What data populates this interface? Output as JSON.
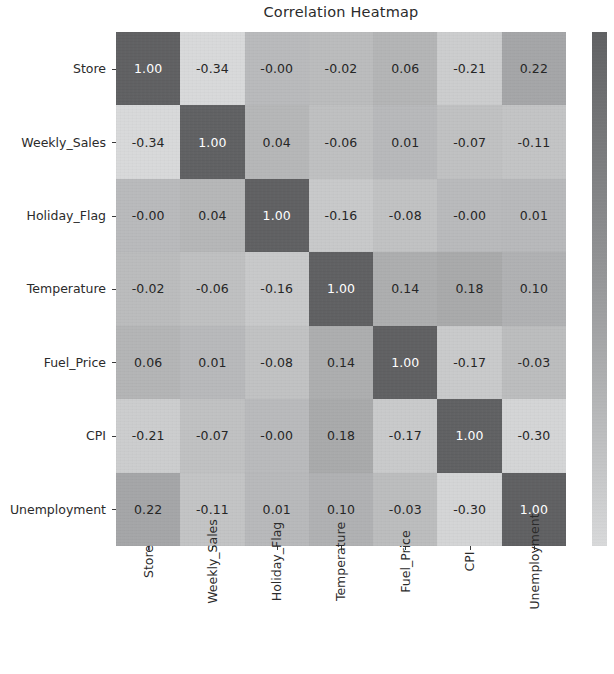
{
  "chart_data": {
    "type": "heatmap",
    "title": "Correlation Heatmap",
    "xlabel": "",
    "ylabel": "",
    "grid": false,
    "legend_position": "right",
    "annotated": true,
    "annotation_format": "0.00",
    "colormap": "grayscale-inverted",
    "colorbar": {
      "orientation": "vertical",
      "position": "right",
      "top_color": "#5f6062",
      "bottom_color": "#d8d9da",
      "tick_labels": []
    },
    "x_categories": [
      "Store",
      "Weekly_Sales",
      "Holiday_Flag",
      "Temperature",
      "Fuel_Price",
      "CPI",
      "Unemployment"
    ],
    "y_categories": [
      "Store",
      "Weekly_Sales",
      "Holiday_Flag",
      "Temperature",
      "Fuel_Price",
      "CPI",
      "Unemployment"
    ],
    "vmin": -0.34,
    "vmax": 1.0,
    "matrix": [
      [
        1.0,
        -0.34,
        -0.0,
        -0.02,
        0.06,
        -0.21,
        0.22
      ],
      [
        -0.34,
        1.0,
        0.04,
        -0.06,
        0.01,
        -0.07,
        -0.11
      ],
      [
        -0.0,
        0.04,
        1.0,
        -0.16,
        -0.08,
        -0.0,
        0.01
      ],
      [
        -0.02,
        -0.06,
        -0.16,
        1.0,
        0.14,
        0.18,
        0.1
      ],
      [
        0.06,
        0.01,
        -0.08,
        0.14,
        1.0,
        -0.17,
        -0.03
      ],
      [
        -0.21,
        -0.07,
        -0.0,
        0.18,
        -0.17,
        1.0,
        -0.3
      ],
      [
        0.22,
        -0.11,
        0.01,
        0.1,
        -0.03,
        -0.3,
        1.0
      ]
    ],
    "cell_labels": [
      [
        "1.00",
        "-0.34",
        "-0.00",
        "-0.02",
        "0.06",
        "-0.21",
        "0.22"
      ],
      [
        "-0.34",
        "1.00",
        "0.04",
        "-0.06",
        "0.01",
        "-0.07",
        "-0.11"
      ],
      [
        "-0.00",
        "0.04",
        "1.00",
        "-0.16",
        "-0.08",
        "-0.00",
        "0.01"
      ],
      [
        "-0.02",
        "-0.06",
        "-0.16",
        "1.00",
        "0.14",
        "0.18",
        "0.10"
      ],
      [
        "0.06",
        "0.01",
        "-0.08",
        "0.14",
        "1.00",
        "-0.17",
        "-0.03"
      ],
      [
        "-0.21",
        "-0.07",
        "-0.00",
        "0.18",
        "-0.17",
        "1.00",
        "-0.30"
      ],
      [
        "0.22",
        "-0.11",
        "0.01",
        "0.10",
        "-0.03",
        "-0.30",
        "1.00"
      ]
    ]
  }
}
